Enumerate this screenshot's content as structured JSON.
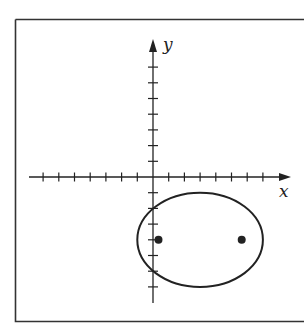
{
  "figure": {
    "axes": {
      "x_label": "x",
      "y_label": "y",
      "origin_px": [
        153,
        177
      ],
      "unit_px": 15.7,
      "x_ticks": [
        -7,
        -6,
        -5,
        -4,
        -3,
        -2,
        -1,
        1,
        2,
        3,
        4,
        5,
        6,
        7
      ],
      "y_ticks": [
        -7,
        -6,
        -5,
        -4,
        -3,
        -2,
        -1,
        1,
        2,
        3,
        4,
        5,
        6,
        7
      ]
    },
    "ellipse": {
      "center": [
        3,
        -4
      ],
      "semi_major_x": 4,
      "semi_minor_y": 3,
      "foci": [
        [
          0.35,
          -4
        ],
        [
          5.65,
          -4
        ]
      ]
    },
    "colors": {
      "stroke": "#222222",
      "frame": "#333333",
      "background": "#ffffff"
    }
  }
}
